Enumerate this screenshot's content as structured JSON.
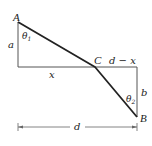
{
  "diagram": {
    "type": "geometry-figure",
    "colors": {
      "background": "#ffffff",
      "thin_line": "#555555",
      "thick_line": "#222222",
      "text": "#222222",
      "dimension_line": "#666666"
    },
    "points": {
      "A": {
        "label": "A",
        "x": 18,
        "y": 22
      },
      "C": {
        "label": "C",
        "x": 95,
        "y": 67
      },
      "B": {
        "label": "B",
        "x": 137,
        "y": 117
      }
    },
    "labels": {
      "point_A": "A",
      "point_B": "B",
      "point_C": "C",
      "side_a": "a",
      "side_b": "b",
      "segment_x": "x",
      "segment_d_minus_x": "d − x",
      "angle_theta1": "θ",
      "angle_theta1_sub": "1",
      "angle_theta2": "θ",
      "angle_theta2_sub": "2",
      "dimension_d": "d"
    }
  }
}
